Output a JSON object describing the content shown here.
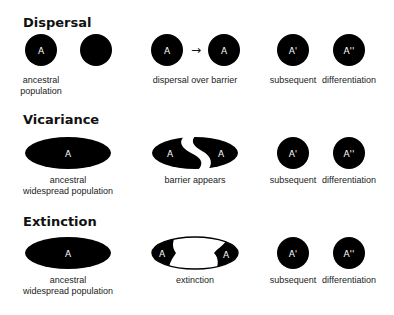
{
  "colors": {
    "shape": "#000000",
    "shape_text": "#ffffff",
    "background": "#ffffff"
  },
  "sections": [
    {
      "title": "Dispersal",
      "stage1": {
        "shapes": [
          "A",
          ""
        ],
        "label_line1": "ancestral",
        "label_line2": "population"
      },
      "stage2": {
        "from": "A",
        "arrow": "→",
        "to": "A",
        "label": "dispersal over barrier"
      },
      "stage3": {
        "left": "A'",
        "right": "A''",
        "label_left": "subsequent",
        "label_right": "differentiation"
      }
    },
    {
      "title": "Vicariance",
      "stage1": {
        "shape": "A",
        "label_line1": "ancestral",
        "label_line2": "widespread population"
      },
      "stage2": {
        "left": "A",
        "right": "A",
        "label": "barrier appears"
      },
      "stage3": {
        "left": "A'",
        "right": "A''",
        "label_left": "subsequent",
        "label_right": "differentiation"
      }
    },
    {
      "title": "Extinction",
      "stage1": {
        "shape": "A",
        "label_line1": "ancestral",
        "label_line2": "widespread population"
      },
      "stage2": {
        "left": "A",
        "right": "A",
        "label": "extinction"
      },
      "stage3": {
        "left": "A'",
        "right": "A''",
        "label_left": "subsequent",
        "label_right": "differentiation"
      }
    }
  ]
}
